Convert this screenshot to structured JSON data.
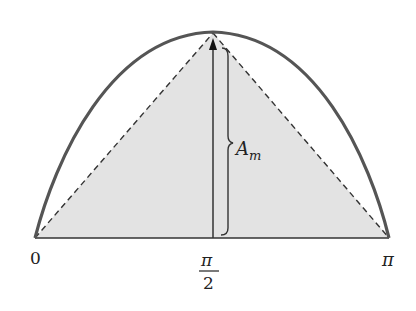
{
  "diagram": {
    "curve": {
      "type": "half-sine arch",
      "color": "#555555"
    },
    "triangle": {
      "fill": "#e3e3e3",
      "edge_style": "dashed"
    },
    "amplitude_label": {
      "main": "A",
      "subscript": "m"
    },
    "x_axis_labels": {
      "left": "0",
      "middle_numerator": "π",
      "middle_denominator": "2",
      "right": "π"
    }
  }
}
